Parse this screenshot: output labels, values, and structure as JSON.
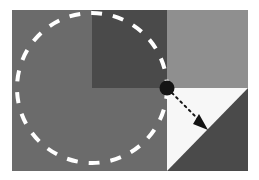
{
  "canvas": {
    "width": 259,
    "height": 180,
    "background": "#ffffff",
    "title": "Dashed circle over quadrant blocks with dotted radius arrow"
  },
  "colors": {
    "page_background": "#ffffff",
    "base_gray": "#6b6b6b",
    "dark_gray": "#4a4a4a",
    "light_gray": "#8f8f8f",
    "white_block": "#f7f7f7",
    "dashed_circle_stroke": "#ffffff",
    "marker_fill": "#141414",
    "arrow_stroke": "#141414"
  },
  "diagram": {
    "content_frame": {
      "x": 12,
      "y": 10,
      "width": 236,
      "height": 161
    },
    "regions": [
      {
        "name": "base-field",
        "label": "base-gray-field",
        "shape": "rect",
        "x": 12,
        "y": 10,
        "width": 236,
        "height": 161,
        "fill": "#6b6b6b"
      },
      {
        "name": "dark-square-upper-middle",
        "label": "dark-gray-square",
        "shape": "rect",
        "x": 92,
        "y": 10,
        "width": 75,
        "height": 78,
        "fill": "#4a4a4a"
      },
      {
        "name": "light-rect-upper-right",
        "label": "light-gray-block",
        "shape": "rect",
        "x": 167,
        "y": 10,
        "width": 81,
        "height": 78,
        "fill": "#8f8f8f"
      },
      {
        "name": "white-square-lower-right",
        "label": "white-block",
        "shape": "rect",
        "x": 167,
        "y": 88,
        "width": 81,
        "height": 83,
        "fill": "#f7f7f7"
      },
      {
        "name": "dark-triangle-lower-right",
        "label": "dark-gray-triangle",
        "shape": "polygon",
        "points": "248,88 248,171 167,171",
        "fill": "#4a4a4a"
      }
    ],
    "dashed_circle": {
      "name": "dashed-circle",
      "center_x": 92,
      "center_y": 88,
      "radius": 75,
      "stroke": "#ffffff",
      "stroke_width": 4,
      "dash_pattern": "11 11"
    },
    "marker_point": {
      "name": "center-marker-dot",
      "x": 167,
      "y": 88,
      "radius": 7.5,
      "fill": "#141414"
    },
    "arrow": {
      "name": "dotted-direction-arrow",
      "start_x": 172,
      "start_y": 93,
      "end_x": 207,
      "end_y": 128,
      "stroke": "#141414",
      "stroke_width": 2,
      "dash_pattern": "2 4",
      "head_points": "207,129 194,123 199,115",
      "head_fill": "#141414"
    }
  }
}
